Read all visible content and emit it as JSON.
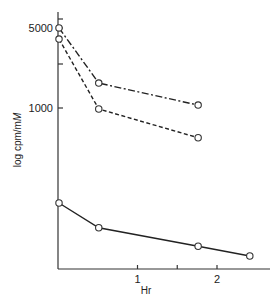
{
  "chart_data": {
    "type": "line",
    "title": "",
    "xlabel": "Hr",
    "ylabel": "log cpm/mM",
    "ylabel_parts": {
      "prefix": "log cpm/m",
      "italic": "M"
    },
    "yscale": "log",
    "xlim": [
      0,
      2.6
    ],
    "ylim": [
      30,
      7000
    ],
    "x_ticks": [
      {
        "value": 1,
        "label": "1"
      },
      {
        "value": 1.5,
        "label": ""
      },
      {
        "value": 2,
        "label": "2"
      }
    ],
    "y_ticks": [
      {
        "value": 1000,
        "label": "1000"
      },
      {
        "value": 2400,
        "label": ""
      },
      {
        "value": 5000,
        "label": "5000"
      },
      {
        "value": 6000,
        "label": ""
      }
    ],
    "grid": false,
    "legend": null,
    "series": [
      {
        "name": "dash-dot series",
        "style": "dashdot",
        "x": [
          0,
          0.5,
          1.75
        ],
        "values": [
          5000,
          1650,
          1060
        ]
      },
      {
        "name": "dashed series",
        "style": "dashed",
        "x": [
          0,
          0.5,
          1.75
        ],
        "values": [
          4000,
          980,
          550
        ]
      },
      {
        "name": "solid series",
        "style": "solid",
        "x": [
          0,
          0.5,
          1.75,
          2.4
        ],
        "values": [
          148,
          90,
          62,
          51
        ]
      }
    ]
  }
}
